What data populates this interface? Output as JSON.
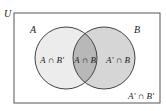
{
  "diagram": {
    "type": "venn",
    "universe_label": "U",
    "sets": [
      {
        "name": "A",
        "label": "A"
      },
      {
        "name": "B",
        "label": "B"
      }
    ],
    "regions": {
      "a_only": "A ∩ B′",
      "a_and_b": "A ∩ B",
      "b_only": "A′ ∩ B",
      "neither": "A′ ∩ B′"
    },
    "colors": {
      "a_only_fill": "#ececec",
      "b_only_fill": "#d6d6d6",
      "intersection_fill": "#b8b8b8",
      "outline": "#444444",
      "background": "#ffffff"
    }
  }
}
